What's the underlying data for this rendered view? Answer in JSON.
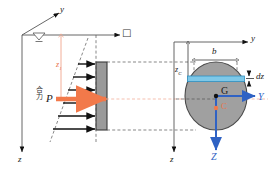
{
  "figure": {
    "title_hidden": "Hydrostatic pressure on a submerged plate",
    "left_panel": {
      "name": "elevation-view",
      "axis_y_label": "y",
      "axis_z_label": "z",
      "axis_x_label": "□",
      "depth_label": "z",
      "depth_label_sub": "1",
      "resultant_label": "P",
      "resultant_text_cjk": "合力",
      "plate_fill": "#9a9a9a",
      "plate_stroke": "#3a3a3a",
      "pressure_arrow_color": "#111111",
      "resultant_color": "#f2794a",
      "dim_line_color": "#f0a58c",
      "free_surface_color": "#555555",
      "pressure_arrow_count": 6
    },
    "right_panel": {
      "name": "plate-plan-view",
      "axis_y_label": "y",
      "axis_z_label": "z",
      "axis_Y_label": "Y",
      "axis_Z_label": "Z",
      "centroid_label": "G",
      "pressure_center_label": "C",
      "width_label": "b",
      "depth_centroid_label": "z",
      "depth_centroid_sub": "C",
      "strip_label": "dz",
      "ellipse_fill": "#a0a0a0",
      "ellipse_stroke": "#4a4a4a",
      "strip_fill": "#7ec8e8",
      "strip_stroke": "#2f8fc0",
      "axis_blue": "#2f62c4",
      "centroid_color": "#111111",
      "pressure_center_color": "#f2794a",
      "dashed_color": "#555555"
    },
    "colors": {
      "background": "#ffffff",
      "accent_orange": "#f2794a",
      "accent_blue": "#2f62c4",
      "gray_body": "#9a9a9a"
    }
  }
}
